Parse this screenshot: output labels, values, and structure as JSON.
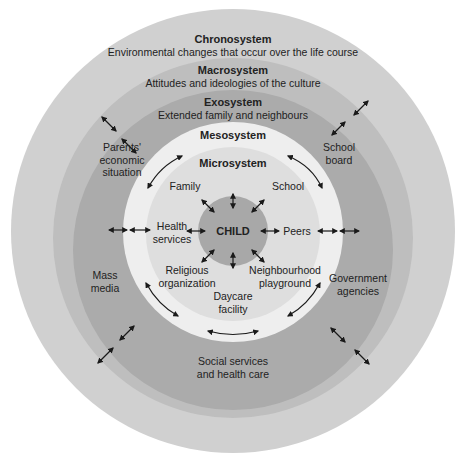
{
  "systems": {
    "chronosystem": {
      "title": "Chronosystem",
      "description": "Environmental changes that occur over the life course",
      "color": "#cfcfcf"
    },
    "macrosystem": {
      "title": "Macrosystem",
      "description": "Attitudes and ideologies of the culture",
      "color": "#bdbdbd"
    },
    "exosystem": {
      "title": "Exosystem",
      "description": "Extended family and neighbours",
      "color": "#a9a9a9"
    },
    "mesosystem": {
      "title": "Mesosystem",
      "color": "#ededed"
    },
    "microsystem": {
      "title": "Microsystem",
      "color": "#dcdcdc"
    },
    "child": {
      "title": "CHILD",
      "color": "#a6a6a6"
    }
  },
  "microsystem_items": {
    "family": "Family",
    "school": "School",
    "health_services": [
      "Health",
      "services"
    ],
    "peers": "Peers",
    "religious_organization": [
      "Religious",
      "organization"
    ],
    "neighbourhood_playground": [
      "Neighbourhood",
      "playground"
    ],
    "daycare_facility": [
      "Daycare",
      "facility"
    ]
  },
  "exosystem_items": {
    "parents_economic_situation": [
      "Parents'",
      "economic",
      "situation"
    ],
    "school_board": [
      "School",
      "board"
    ],
    "mass_media": [
      "Mass",
      "media"
    ],
    "government_agencies": [
      "Government",
      "agencies"
    ],
    "social_services": [
      "Social services",
      "and health care"
    ]
  },
  "arrow_color": "#1a1a1a"
}
